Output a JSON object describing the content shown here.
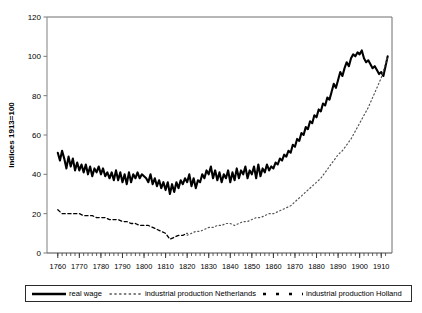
{
  "chart_data": {
    "type": "line",
    "title": "",
    "xlabel": "",
    "ylabel": "Indices 1913=100",
    "xlim": [
      1755,
      1915
    ],
    "ylim": [
      0,
      120
    ],
    "yticks": [
      0,
      20,
      40,
      60,
      80,
      100,
      120
    ],
    "xticks": [
      1760,
      1770,
      1780,
      1790,
      1800,
      1810,
      1820,
      1830,
      1840,
      1850,
      1860,
      1870,
      1880,
      1890,
      1900,
      1910
    ],
    "xtick_labels": [
      "1760",
      "1770",
      "1780",
      "1790",
      "1800",
      "1810",
      "1820",
      "1830",
      "1840",
      "1850",
      "1860",
      "1870",
      "1880",
      "1890",
      "1900",
      "1910"
    ],
    "ytick_labels": [
      "0",
      "20",
      "40",
      "60",
      "80",
      "100",
      "120"
    ],
    "grid": false,
    "minor_tick_interval": 2,
    "legend_position": "below-plot",
    "series": [
      {
        "name": "real wage",
        "style": "solid",
        "color": "#000000",
        "width": 2.1,
        "x": [
          1760,
          1761,
          1762,
          1763,
          1764,
          1765,
          1766,
          1767,
          1768,
          1769,
          1770,
          1771,
          1772,
          1773,
          1774,
          1775,
          1776,
          1777,
          1778,
          1779,
          1780,
          1781,
          1782,
          1783,
          1784,
          1785,
          1786,
          1787,
          1788,
          1789,
          1790,
          1791,
          1792,
          1793,
          1794,
          1795,
          1796,
          1797,
          1798,
          1799,
          1800,
          1801,
          1802,
          1803,
          1804,
          1805,
          1806,
          1807,
          1808,
          1809,
          1810,
          1811,
          1812,
          1813,
          1814,
          1815,
          1816,
          1817,
          1818,
          1819,
          1820,
          1821,
          1822,
          1823,
          1824,
          1825,
          1826,
          1827,
          1828,
          1829,
          1830,
          1831,
          1832,
          1833,
          1834,
          1835,
          1836,
          1837,
          1838,
          1839,
          1840,
          1841,
          1842,
          1843,
          1844,
          1845,
          1846,
          1847,
          1848,
          1849,
          1850,
          1851,
          1852,
          1853,
          1854,
          1855,
          1856,
          1857,
          1858,
          1859,
          1860,
          1861,
          1862,
          1863,
          1864,
          1865,
          1866,
          1867,
          1868,
          1869,
          1870,
          1871,
          1872,
          1873,
          1874,
          1875,
          1876,
          1877,
          1878,
          1879,
          1880,
          1881,
          1882,
          1883,
          1884,
          1885,
          1886,
          1887,
          1888,
          1889,
          1890,
          1891,
          1892,
          1893,
          1894,
          1895,
          1896,
          1897,
          1898,
          1899,
          1900,
          1901,
          1902,
          1903,
          1904,
          1905,
          1906,
          1907,
          1908,
          1909,
          1910,
          1911,
          1912,
          1913
        ],
        "values": [
          51,
          47,
          52,
          48,
          43,
          49,
          44,
          48,
          42,
          46,
          42,
          45,
          41,
          45,
          40,
          44,
          39,
          43,
          41,
          44,
          40,
          43,
          39,
          41,
          38,
          41,
          37,
          42,
          37,
          41,
          36,
          40,
          35,
          41,
          36,
          40,
          38,
          41,
          38,
          40,
          39,
          38,
          36,
          40,
          35,
          38,
          34,
          37,
          33,
          36,
          32,
          36,
          30,
          35,
          31,
          36,
          33,
          37,
          35,
          38,
          36,
          40,
          34,
          38,
          33,
          37,
          36,
          40,
          38,
          42,
          40,
          44,
          38,
          42,
          37,
          41,
          36,
          40,
          38,
          42,
          36,
          41,
          37,
          43,
          38,
          42,
          40,
          44,
          38,
          42,
          40,
          44,
          38,
          45,
          39,
          43,
          41,
          45,
          42,
          44,
          43,
          46,
          45,
          48,
          47,
          50,
          49,
          52,
          51,
          55,
          54,
          58,
          57,
          61,
          60,
          64,
          63,
          67,
          66,
          70,
          69,
          73,
          72,
          76,
          75,
          79,
          78,
          82,
          86,
          84,
          88,
          92,
          90,
          94,
          97,
          95,
          99,
          101,
          100,
          102,
          101,
          103,
          99,
          97,
          98,
          96,
          94,
          95,
          93,
          91,
          92,
          90,
          95,
          100
        ]
      },
      {
        "name": "industrial production Holland",
        "style": "dashed",
        "color": "#000000",
        "width": 1.3,
        "x": [
          1760,
          1762,
          1764,
          1766,
          1768,
          1770,
          1772,
          1774,
          1776,
          1778,
          1780,
          1782,
          1784,
          1786,
          1788,
          1790,
          1792,
          1794,
          1796,
          1798,
          1800,
          1802,
          1804,
          1806,
          1808,
          1810,
          1812,
          1814,
          1816,
          1818,
          1820
        ],
        "values": [
          22,
          20,
          20,
          20,
          20,
          20,
          19,
          19,
          19,
          18,
          18,
          18,
          17,
          17,
          17,
          16,
          16,
          15,
          15,
          14,
          14,
          14,
          13,
          12,
          11,
          10,
          7,
          8,
          9,
          9,
          10
        ]
      },
      {
        "name": "industrial production Netherlands",
        "style": "dotted",
        "color": "#555555",
        "width": 1.2,
        "x": [
          1820,
          1822,
          1824,
          1826,
          1828,
          1830,
          1832,
          1834,
          1836,
          1838,
          1840,
          1842,
          1844,
          1846,
          1848,
          1850,
          1852,
          1854,
          1856,
          1858,
          1860,
          1862,
          1864,
          1866,
          1868,
          1870,
          1872,
          1874,
          1876,
          1878,
          1880,
          1882,
          1884,
          1886,
          1888,
          1890,
          1892,
          1894,
          1896,
          1898,
          1900,
          1902,
          1904,
          1906,
          1908,
          1910,
          1913
        ],
        "values": [
          9,
          10,
          11,
          11,
          12,
          13,
          13,
          14,
          14,
          15,
          15,
          14,
          15,
          16,
          16,
          17,
          18,
          18,
          19,
          20,
          20,
          21,
          22,
          23,
          24,
          26,
          28,
          30,
          32,
          34,
          36,
          38,
          41,
          44,
          47,
          50,
          52,
          55,
          58,
          62,
          66,
          70,
          74,
          79,
          84,
          89,
          100
        ]
      }
    ]
  },
  "legend": {
    "items": [
      {
        "label": "real wage",
        "marker": "solid-line"
      },
      {
        "label": "industrial production Netherlands",
        "marker": "dotted-line"
      },
      {
        "label": "industrial production Holland",
        "marker": "dashed-line"
      }
    ]
  },
  "axis": {
    "ylabel": "Indices 1913=100"
  }
}
